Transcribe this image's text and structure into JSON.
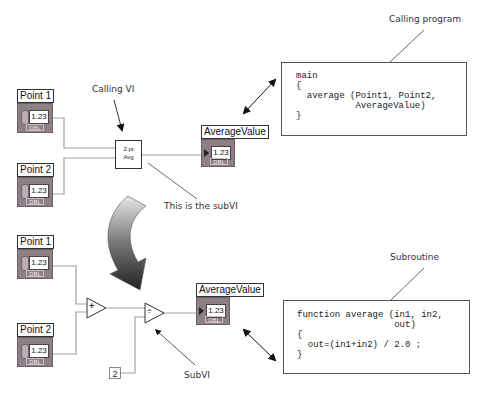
{
  "top_diagram": {
    "controls": [
      {
        "label": "Point 1",
        "value": "1.23",
        "type": "DBL"
      },
      {
        "label": "Point 2",
        "value": "1.23",
        "type": "DBL"
      }
    ],
    "subvi": {
      "line1": "2 pt",
      "line2": "Avg"
    },
    "indicator": {
      "label": "AverageValue",
      "value": "1.23",
      "type": "DBL"
    },
    "annotations": {
      "calling_vi": "Calling VI",
      "this_is_subvi": "This is the subVI",
      "calling_program": "Calling program"
    },
    "code": {
      "lines": [
        "main",
        "{",
        "  average (Point1, Point2,",
        "           AverageValue)",
        "}"
      ]
    }
  },
  "bottom_diagram": {
    "controls": [
      {
        "label": "Point 1",
        "value": "1.23",
        "type": "DBL"
      },
      {
        "label": "Point 2",
        "value": "1.23",
        "type": "DBL"
      }
    ],
    "add_symbol": "+",
    "divide_symbol": "÷",
    "constant": "2",
    "indicator": {
      "label": "AverageValue",
      "value": "1.23",
      "type": "DBL"
    },
    "annotations": {
      "subroutine": "Subroutine",
      "subvi": "SubVI"
    },
    "code": {
      "lines": [
        "function average (in1, in2,",
        "                  out)",
        "{",
        "  out=(in1+in2) / 2.0 ;",
        "}"
      ]
    }
  }
}
